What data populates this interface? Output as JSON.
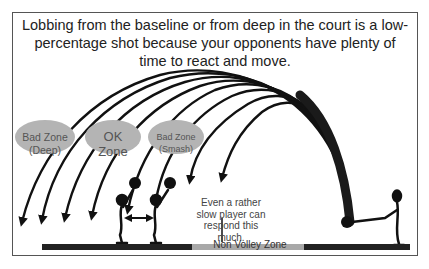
{
  "caption": "Lobbing from the baseline or from deep in the court is a low-percentage shot because your opponents have plenty of time to react and move.",
  "zones": [
    {
      "line1": "Bad Zone",
      "line2": "(Deep)"
    },
    {
      "line1": "OK",
      "line2": "Zone"
    },
    {
      "line1": "Bad Zone",
      "line2": "(Smash)"
    }
  ],
  "note": "Even a rather slow player can respond this much.",
  "court": {
    "non_volley_zone_label": "Non Volley Zone"
  },
  "colors": {
    "zone_fill": "#b4b4b4",
    "court_dark": "#222222",
    "court_nvz": "#a8a8a8",
    "ink": "#111111"
  }
}
